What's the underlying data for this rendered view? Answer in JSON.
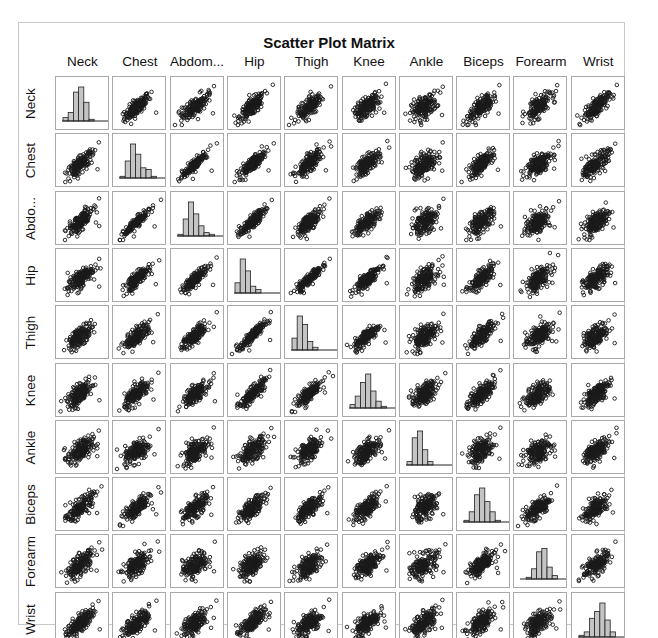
{
  "chart_data": {
    "type": "scatter",
    "subtype": "scatter-matrix",
    "title": "Scatter Plot Matrix",
    "variables": [
      "Neck",
      "Chest",
      "Abdom...",
      "Hip",
      "Thigh",
      "Knee",
      "Ankle",
      "Biceps",
      "Forearm",
      "Wrist"
    ],
    "row_labels": [
      "Neck",
      "Chest",
      "Abdo...",
      "Hip",
      "Thigh",
      "Knee",
      "Ankle",
      "Biceps",
      "Forearm",
      "Wrist"
    ],
    "diagonal": "histogram",
    "histograms": [
      {
        "variable": "Neck",
        "bins": [
          0.1,
          0.25,
          0.85,
          1.0,
          0.55,
          0.05,
          0.02,
          0.02
        ]
      },
      {
        "variable": "Chest",
        "bins": [
          0.05,
          0.5,
          1.0,
          0.7,
          0.3,
          0.25,
          0.05,
          0.02
        ]
      },
      {
        "variable": "Abdom...",
        "bins": [
          0.05,
          0.5,
          1.0,
          0.65,
          0.3,
          0.1,
          0.05,
          0.02
        ]
      },
      {
        "variable": "Hip",
        "bins": [
          0.3,
          1.0,
          0.65,
          0.2,
          0.1,
          0.02,
          0.0,
          0.02
        ]
      },
      {
        "variable": "Thigh",
        "bins": [
          0.35,
          1.0,
          0.75,
          0.25,
          0.08,
          0.02,
          0.0,
          0.02
        ]
      },
      {
        "variable": "Knee",
        "bins": [
          0.1,
          0.35,
          0.75,
          1.0,
          0.5,
          0.2,
          0.05,
          0.02
        ]
      },
      {
        "variable": "Ankle",
        "bins": [
          0.1,
          0.8,
          1.0,
          0.45,
          0.1,
          0.02,
          0.0,
          0.02
        ]
      },
      {
        "variable": "Biceps",
        "bins": [
          0.05,
          0.3,
          0.8,
          1.0,
          0.6,
          0.3,
          0.05,
          0.02
        ]
      },
      {
        "variable": "Forearm",
        "bins": [
          0.02,
          0.05,
          0.3,
          0.8,
          0.9,
          0.35,
          0.1,
          0.02
        ]
      },
      {
        "variable": "Wrist",
        "bins": [
          0.05,
          0.15,
          0.55,
          0.75,
          1.0,
          0.5,
          0.15,
          0.03
        ]
      }
    ],
    "correlations": [
      [
        1,
        0.78,
        0.75,
        0.73,
        0.7,
        0.67,
        0.48,
        0.73,
        0.62,
        0.74
      ],
      [
        0.78,
        1,
        0.92,
        0.83,
        0.73,
        0.72,
        0.48,
        0.73,
        0.58,
        0.66
      ],
      [
        0.75,
        0.92,
        1,
        0.87,
        0.77,
        0.74,
        0.45,
        0.68,
        0.5,
        0.62
      ],
      [
        0.73,
        0.83,
        0.87,
        1,
        0.9,
        0.82,
        0.56,
        0.74,
        0.55,
        0.63
      ],
      [
        0.7,
        0.73,
        0.77,
        0.9,
        1,
        0.8,
        0.54,
        0.76,
        0.57,
        0.56
      ],
      [
        0.67,
        0.72,
        0.74,
        0.82,
        0.8,
        1,
        0.61,
        0.68,
        0.56,
        0.66
      ],
      [
        0.48,
        0.48,
        0.45,
        0.56,
        0.54,
        0.61,
        1,
        0.48,
        0.42,
        0.57
      ],
      [
        0.73,
        0.73,
        0.68,
        0.74,
        0.76,
        0.68,
        0.48,
        1,
        0.68,
        0.63
      ],
      [
        0.62,
        0.58,
        0.5,
        0.55,
        0.57,
        0.56,
        0.42,
        0.68,
        1,
        0.59
      ],
      [
        0.74,
        0.66,
        0.62,
        0.63,
        0.56,
        0.66,
        0.57,
        0.63,
        0.59,
        1
      ]
    ],
    "points_per_panel": 250,
    "marker": "open-circle",
    "grid": false,
    "legend": "none",
    "xlabel": "",
    "ylabel": ""
  },
  "colors": {
    "bar_fill": "#c4c4c4",
    "bar_edge": "#222222",
    "marker": "#1a1a1a",
    "cell_border": "#a9a9a9",
    "frame_border": "#c8c8c8"
  }
}
